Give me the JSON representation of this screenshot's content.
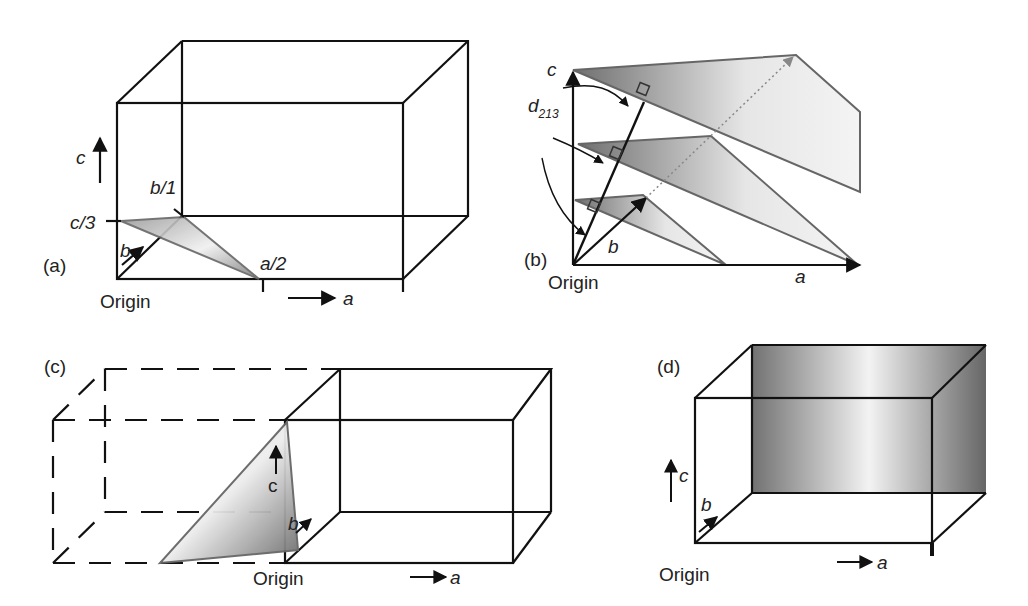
{
  "figure": {
    "panels": [
      {
        "id": "a",
        "label": "(a)",
        "axes": {
          "a": "a",
          "b": "b",
          "c": "c"
        },
        "origin_label": "Origin",
        "intercepts": {
          "a": "a/2",
          "b": "b/1",
          "c": "c/3"
        },
        "plane": "(213)"
      },
      {
        "id": "b",
        "label": "(b)",
        "axes": {
          "a": "a",
          "b": "b",
          "c": "c"
        },
        "origin_label": "Origin",
        "spacing_label": "d",
        "spacing_subscript": "213",
        "plane_count": 3
      },
      {
        "id": "c",
        "label": "(c)",
        "axes": {
          "a": "a",
          "b": "b",
          "c": "c"
        },
        "origin_label": "Origin"
      },
      {
        "id": "d",
        "label": "(d)",
        "axes": {
          "a": "a",
          "b": "b",
          "c": "c"
        },
        "origin_label": "Origin"
      }
    ]
  },
  "colors": {
    "line": "#111111",
    "plane_dark": "#6e6e6e",
    "plane_light": "#f2f2f2",
    "plane_edge": "#666666",
    "text": "#222222"
  }
}
